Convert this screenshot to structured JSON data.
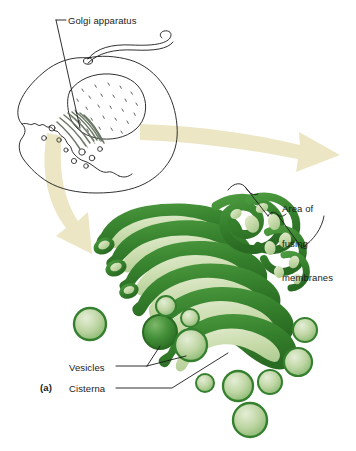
{
  "figure": {
    "panel_letter": "(a)",
    "subject": "Golgi apparatus",
    "background_color": "#ffffff"
  },
  "labels": {
    "golgi_apparatus": "Golgi apparatus",
    "area_of_fusing_membranes": {
      "line1": "Area of",
      "line2": "fusing",
      "line3": "membranes"
    },
    "vesicles": "Vesicles",
    "cisterna": "Cisterna"
  },
  "colors": {
    "ink": "#1a1a1a",
    "membrane_dark_green": "#3c8c34",
    "membrane_deep_green": "#2c7328",
    "lumen_pale_green": "#cfdfb4",
    "lumen_light_green": "#b6d19a",
    "vesicle_rim": "#35802e",
    "vesicle_fill": "#bcd6a2",
    "arrow_cream": "#ece6c4",
    "cell_outline": "#1a1a1a",
    "golgi_gray": "#6f7b6a"
  },
  "structures": {
    "cell_overview": {
      "name": "eukaryotic cell outline",
      "parts": [
        "plasma membrane",
        "flagellum",
        "nucleus",
        "golgi apparatus",
        "vesicles"
      ]
    },
    "magnified_golgi": {
      "name": "golgi apparatus magnified",
      "parts": [
        "cisternae stack",
        "fusing membrane region",
        "transport vesicles"
      ]
    },
    "arrows": [
      {
        "name": "magnification-arrow-right",
        "direction": "right"
      },
      {
        "name": "magnification-arrow-down",
        "direction": "down-right"
      }
    ]
  }
}
